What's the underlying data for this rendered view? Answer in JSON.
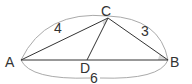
{
  "diagram": {
    "type": "triangle",
    "points": {
      "A": {
        "label": "A",
        "x": 21,
        "y": 60
      },
      "B": {
        "label": "B",
        "x": 168,
        "y": 60
      },
      "C": {
        "label": "C",
        "x": 108,
        "y": 18
      },
      "D": {
        "label": "D",
        "x": 87,
        "y": 60
      }
    },
    "segments": [
      {
        "from": "A",
        "to": "B"
      },
      {
        "from": "A",
        "to": "C"
      },
      {
        "from": "C",
        "to": "B"
      },
      {
        "from": "C",
        "to": "D"
      }
    ],
    "lengths": {
      "AC": "4",
      "CB": "3",
      "AB": "6"
    },
    "angle_marks": [
      "ACD",
      "CBA"
    ],
    "colors": {
      "line": "#333333",
      "arc": "#aaaaaa",
      "angle_fill": "#d8d8d8"
    }
  }
}
